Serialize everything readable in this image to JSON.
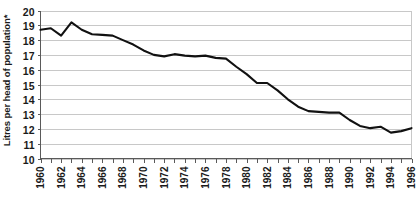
{
  "chart_data": {
    "type": "line",
    "title": "",
    "subtitle": "",
    "xlabel": "",
    "ylabel": "Litres per head of population*",
    "ylim": [
      10,
      20
    ],
    "xlim": [
      1960,
      1996
    ],
    "grid": true,
    "grid_orientation": "horizontal",
    "legend": false,
    "legend_position": "none",
    "line_color": "#111111",
    "grid_color": "#c8c8c8",
    "axis_color": "#5a5a5a",
    "background_color": "#ffffff",
    "y_ticks": [
      10,
      11,
      12,
      13,
      14,
      15,
      16,
      17,
      18,
      19,
      20
    ],
    "y_tick_labels": [
      "10",
      "11",
      "12",
      "13",
      "14",
      "15",
      "16",
      "17",
      "18",
      "19",
      "20"
    ],
    "x_tick_labels": [
      "1960",
      "1962",
      "1964",
      "1966",
      "1968",
      "1970",
      "1972",
      "1974",
      "1976",
      "1978",
      "1980",
      "1982",
      "1984",
      "1986",
      "1988",
      "1990",
      "1992",
      "1994",
      "1996"
    ],
    "x_tick_label_rotation": -90,
    "x_minor_ticks_every_year": true,
    "x": [
      1960,
      1961,
      1962,
      1963,
      1964,
      1965,
      1966,
      1967,
      1968,
      1969,
      1970,
      1971,
      1972,
      1973,
      1974,
      1975,
      1976,
      1977,
      1978,
      1979,
      1980,
      1981,
      1982,
      1983,
      1984,
      1985,
      1986,
      1987,
      1988,
      1989,
      1990,
      1991,
      1992,
      1993,
      1994,
      1995,
      1996
    ],
    "values": [
      18.7,
      18.8,
      18.3,
      19.2,
      18.7,
      18.4,
      18.35,
      18.3,
      18.0,
      17.7,
      17.3,
      17.0,
      16.9,
      17.05,
      16.95,
      16.9,
      16.95,
      16.8,
      16.75,
      16.2,
      15.7,
      15.1,
      15.1,
      14.6,
      14.0,
      13.5,
      13.2,
      13.15,
      13.1,
      13.1,
      12.6,
      12.2,
      12.05,
      12.15,
      11.75,
      11.85,
      12.05
    ],
    "series": [
      {
        "name": "Litres per head of population",
        "values": [
          18.7,
          18.8,
          18.3,
          19.2,
          18.7,
          18.4,
          18.35,
          18.3,
          18.0,
          17.7,
          17.3,
          17.0,
          16.9,
          17.05,
          16.95,
          16.9,
          16.95,
          16.8,
          16.75,
          16.2,
          15.7,
          15.1,
          15.1,
          14.6,
          14.0,
          13.5,
          13.2,
          13.15,
          13.1,
          13.1,
          12.6,
          12.2,
          12.05,
          12.15,
          11.75,
          11.85,
          12.05
        ]
      }
    ],
    "annotations": [],
    "notes": {
      "peak_year": "1963",
      "peak_value": "19.2",
      "min_year": "1994",
      "min_value": "11.75"
    }
  }
}
